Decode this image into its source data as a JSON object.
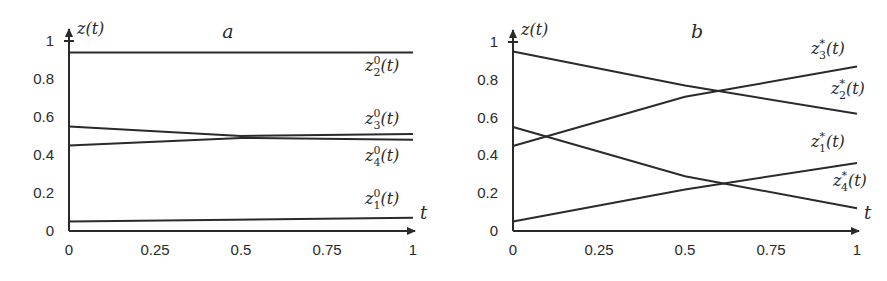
{
  "chart_data": [
    {
      "type": "line",
      "panel": "a",
      "title": "a",
      "xlabel": "t",
      "ylabel": "z(t)",
      "xlim": [
        0,
        1
      ],
      "ylim": [
        0,
        1
      ],
      "xticks": [
        "0",
        "0.25",
        "0.5",
        "0.75",
        "1"
      ],
      "yticks": [
        "0",
        "0.2",
        "0.4",
        "0.6",
        "0.8",
        "1"
      ],
      "grid": false,
      "series": [
        {
          "name": "z_2^0(t)",
          "label_main": "z",
          "label_sup": "0",
          "label_sub": "2",
          "x": [
            0,
            1
          ],
          "y": [
            0.94,
            0.94
          ]
        },
        {
          "name": "z_3^0(t)",
          "label_main": "z",
          "label_sup": "0",
          "label_sub": "3",
          "x": [
            0,
            0.5,
            1
          ],
          "y": [
            0.55,
            0.5,
            0.51
          ]
        },
        {
          "name": "z_4^0(t)",
          "label_main": "z",
          "label_sup": "0",
          "label_sub": "4",
          "x": [
            0,
            0.5,
            1
          ],
          "y": [
            0.45,
            0.49,
            0.48
          ]
        },
        {
          "name": "z_1^0(t)",
          "label_main": "z",
          "label_sup": "0",
          "label_sub": "1",
          "x": [
            0,
            1
          ],
          "y": [
            0.05,
            0.07
          ]
        }
      ]
    },
    {
      "type": "line",
      "panel": "b",
      "title": "b",
      "xlabel": "t",
      "ylabel": "z(t)",
      "xlim": [
        0,
        1
      ],
      "ylim": [
        0,
        1
      ],
      "xticks": [
        "0",
        "0.25",
        "0.5",
        "0.75",
        "1"
      ],
      "yticks": [
        "0",
        "0.2",
        "0.4",
        "0.6",
        "0.8",
        "1"
      ],
      "grid": false,
      "series": [
        {
          "name": "z_3^*(t)",
          "label_main": "z",
          "label_sup": "*",
          "label_sub": "3",
          "x": [
            0,
            0.5,
            1
          ],
          "y": [
            0.45,
            0.71,
            0.87
          ]
        },
        {
          "name": "z_2^*(t)",
          "label_main": "z",
          "label_sup": "*",
          "label_sub": "2",
          "x": [
            0,
            0.5,
            1
          ],
          "y": [
            0.95,
            0.77,
            0.62
          ]
        },
        {
          "name": "z_1^*(t)",
          "label_main": "z",
          "label_sup": "*",
          "label_sub": "1",
          "x": [
            0,
            0.5,
            1
          ],
          "y": [
            0.05,
            0.22,
            0.36
          ]
        },
        {
          "name": "z_4^*(t)",
          "label_main": "z",
          "label_sup": "*",
          "label_sub": "4",
          "x": [
            0,
            0.5,
            1
          ],
          "y": [
            0.55,
            0.29,
            0.12
          ]
        }
      ]
    }
  ]
}
